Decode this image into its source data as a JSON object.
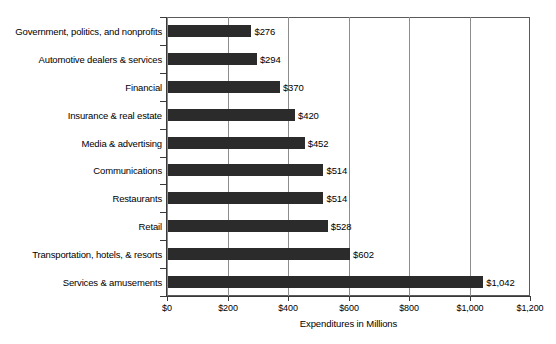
{
  "chart_data": {
    "type": "bar",
    "orientation": "horizontal",
    "title": "",
    "xlabel": "Expenditures in Millions",
    "ylabel": "",
    "xlim": [
      0,
      1200
    ],
    "xticks": [
      0,
      200,
      400,
      600,
      800,
      1000,
      1200
    ],
    "xtick_labels": [
      "$0",
      "$200",
      "$400",
      "$600",
      "$800",
      "$1,000",
      "$1,200"
    ],
    "grid": true,
    "grid_axis": "x",
    "legend": false,
    "bar_color": "#2b2b2b",
    "categories": [
      "Government, politics, and nonprofits",
      "Automotive dealers & services",
      "Financial",
      "Insurance & real estate",
      "Media & advertising",
      "Communications",
      "Restaurants",
      "Retail",
      "Transportation, hotels, & resorts",
      "Services & amusements"
    ],
    "values": [
      276,
      294,
      370,
      420,
      452,
      514,
      514,
      528,
      602,
      1042
    ],
    "value_labels": [
      "$276",
      "$294",
      "$370",
      "$420",
      "$452",
      "$514",
      "$514",
      "$528",
      "$602",
      "$1,042"
    ]
  }
}
